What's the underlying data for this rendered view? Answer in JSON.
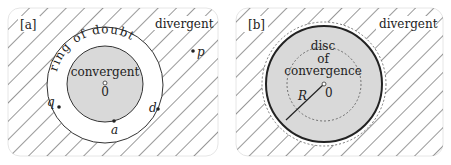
{
  "panels": [
    {
      "id": "a",
      "tag": "[a]",
      "regions": {
        "outer": "divergent",
        "ring": "ring of doubt",
        "inner": "convergent"
      },
      "center_label": "0",
      "points": [
        {
          "label": "p",
          "role": "divergent point"
        },
        {
          "label": "q",
          "role": "point in ring of doubt"
        },
        {
          "label": "a",
          "role": "point on inner circle"
        },
        {
          "label": "d",
          "role": "point on outer circle"
        }
      ]
    },
    {
      "id": "b",
      "tag": "[b]",
      "regions": {
        "outer": "divergent",
        "inner_line1": "disc",
        "inner_line2": "of",
        "inner_line3": "convergence"
      },
      "center_label": "0",
      "radius_label": "R"
    }
  ],
  "colors": {
    "hatch": "#333333",
    "disc_fill": "#d9d9d9",
    "panel_border": "#e6e6e6",
    "text": "#222222"
  }
}
